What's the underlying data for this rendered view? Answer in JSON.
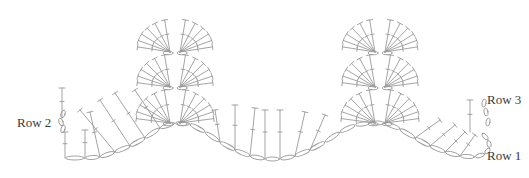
{
  "diagram": {
    "type": "crochet-stitch-chart",
    "stroke_color": "#9a9a9a",
    "label_color": "#3a3a3a",
    "background": "#ffffff",
    "labels": [
      {
        "id": "row-2",
        "text": "Row 2",
        "x": 17,
        "y": 115
      },
      {
        "id": "row-3",
        "text": "Row 3",
        "x": 487,
        "y": 92
      },
      {
        "id": "row-1",
        "text": "Row 1",
        "x": 487,
        "y": 148
      }
    ],
    "peaks": [
      {
        "cx": 175,
        "fans": [
          {
            "cy": 123,
            "r": 34,
            "spread": 80
          },
          {
            "cy": 87,
            "r": 33,
            "spread": 80
          },
          {
            "cy": 52,
            "r": 33,
            "spread": 78
          }
        ]
      },
      {
        "cx": 380,
        "fans": [
          {
            "cy": 123,
            "r": 34,
            "spread": 80
          },
          {
            "cy": 87,
            "r": 33,
            "spread": 80
          },
          {
            "cy": 52,
            "r": 33,
            "spread": 78
          }
        ]
      }
    ],
    "row1_chain": [
      [
        65,
        158
      ],
      [
        85,
        158
      ],
      [
        100,
        157
      ],
      [
        115,
        152
      ],
      [
        130,
        146
      ],
      [
        145,
        138
      ],
      [
        160,
        128
      ],
      [
        175,
        123
      ],
      [
        190,
        124
      ],
      [
        205,
        132
      ],
      [
        220,
        142
      ],
      [
        235,
        150
      ],
      [
        250,
        156
      ],
      [
        265,
        159
      ],
      [
        280,
        159
      ],
      [
        295,
        156
      ],
      [
        310,
        150
      ],
      [
        325,
        142
      ],
      [
        340,
        132
      ],
      [
        355,
        125
      ],
      [
        370,
        123
      ],
      [
        385,
        123
      ],
      [
        400,
        129
      ],
      [
        415,
        138
      ],
      [
        430,
        146
      ],
      [
        445,
        152
      ],
      [
        460,
        156
      ],
      [
        475,
        157
      ],
      [
        485,
        154
      ],
      [
        490,
        148
      ],
      [
        488,
        140
      ],
      [
        482,
        133
      ]
    ]
  }
}
